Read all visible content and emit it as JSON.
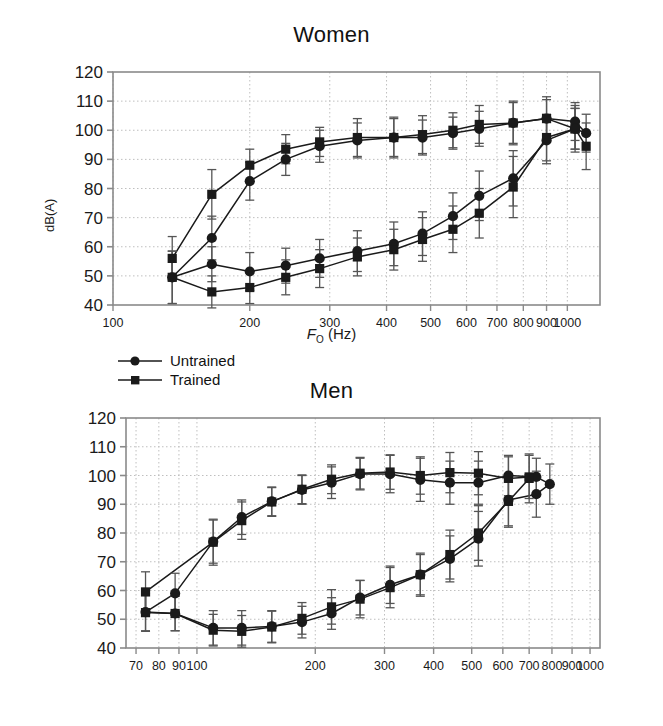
{
  "figure": {
    "xlabel_main": "F",
    "xlabel_sub": "O",
    "xlabel_unit": "(Hz)",
    "ylabel": "dB(A)"
  },
  "legend": {
    "position": "between-panels-left",
    "items": [
      {
        "label": "Untrained",
        "marker": "circle",
        "color": "#1a1a1a"
      },
      {
        "label": "Trained",
        "marker": "square",
        "color": "#1a1a1a"
      }
    ]
  },
  "colors": {
    "line": "#1a1a1a",
    "marker": "#1a1a1a",
    "errorbar": "#555555",
    "grid": "#bfbfbf",
    "axis": "#8a8a8a",
    "text": "#1a1a1a",
    "background": "#ffffff"
  },
  "chart_data": [
    {
      "type": "line",
      "id": "women",
      "title": "Women",
      "xlabel": "F_O (Hz)",
      "ylabel": "dB(A)",
      "xscale": "log",
      "xlim": [
        100,
        1180
      ],
      "ylim": [
        40,
        120
      ],
      "yticks": [
        40,
        50,
        60,
        70,
        80,
        90,
        100,
        110,
        120
      ],
      "xticks": [
        100,
        200,
        300,
        400,
        500,
        600,
        700,
        800,
        900,
        1000
      ],
      "xticklabels": [
        "100",
        "200",
        "300",
        "400",
        "500",
        "600",
        "700",
        "800",
        "900",
        "1000"
      ],
      "grid": true,
      "series": [
        {
          "name": "Untrained",
          "marker": "circle",
          "branch_upper": {
            "x": [
              165,
              200,
              240,
              285,
              345,
              415,
              480,
              560,
              640,
              760,
              900,
              1040,
              1100
            ],
            "y": [
              63.0,
              82.5,
              90.0,
              94.5,
              96.5,
              97.5,
              97.5,
              99.0,
              100.5,
              102.5,
              104.0,
              103.0,
              99.0
            ],
            "yerr": [
              7.5,
              6.5,
              5.5,
              5.5,
              6.0,
              7.0,
              6.0,
              5.5,
              6.0,
              7.0,
              6.5,
              6.5,
              6.5
            ]
          },
          "branch_lower": {
            "x": [
              135,
              165,
              200,
              240,
              285,
              345,
              415,
              480,
              560,
              640,
              760,
              900,
              1040
            ],
            "y": [
              49.5,
              54.0,
              51.5,
              53.5,
              56.0,
              58.5,
              61.0,
              64.5,
              70.5,
              77.5,
              83.5,
              96.5,
              100.5
            ],
            "yerr": [
              9.0,
              6.0,
              6.5,
              6.0,
              6.5,
              7.0,
              7.5,
              7.5,
              8.0,
              8.5,
              9.5,
              8.0,
              7.0
            ]
          }
        },
        {
          "name": "Trained",
          "marker": "square",
          "branch_upper": {
            "x": [
              135,
              165,
              200,
              240,
              285,
              345,
              415,
              480,
              560,
              640,
              760,
              900,
              1040,
              1100
            ],
            "y": [
              56.0,
              78.0,
              88.0,
              93.5,
              96.0,
              97.5,
              97.5,
              98.5,
              100.0,
              102.0,
              102.5,
              104.0,
              100.5,
              94.5
            ],
            "yerr": [
              7.5,
              8.5,
              5.5,
              5.0,
              5.0,
              6.5,
              6.5,
              6.5,
              6.0,
              6.5,
              7.5,
              7.5,
              8.0,
              8.0
            ]
          },
          "branch_lower": {
            "x": [
              135,
              165,
              200,
              240,
              285,
              345,
              415,
              480,
              560,
              640,
              760,
              900,
              1040
            ],
            "y": [
              49.5,
              44.5,
              46.0,
              49.5,
              52.5,
              56.5,
              59.0,
              62.5,
              66.0,
              71.5,
              80.5,
              97.5,
              100.5
            ],
            "yerr": [
              9.0,
              5.5,
              5.5,
              6.0,
              6.5,
              6.5,
              7.0,
              7.5,
              8.0,
              8.5,
              10.5,
              8.0,
              7.0
            ]
          }
        }
      ]
    },
    {
      "type": "line",
      "id": "men",
      "title": "Men",
      "xlabel": "F_O (Hz)",
      "ylabel": "dB(A)",
      "xscale": "log",
      "xlim": [
        66,
        1060
      ],
      "ylim": [
        40,
        120
      ],
      "yticks": [
        40,
        50,
        60,
        70,
        80,
        90,
        100,
        110,
        120
      ],
      "xticks": [
        70,
        80,
        90,
        100,
        200,
        300,
        400,
        500,
        600,
        700,
        800,
        900,
        1000
      ],
      "xticklabels": [
        "70",
        "80",
        "90",
        "100",
        "200",
        "300",
        "400",
        "500",
        "600",
        "700",
        "800",
        "900",
        "1000"
      ],
      "grid": true,
      "series": [
        {
          "name": "Untrained",
          "marker": "circle",
          "branch_upper": {
            "x": [
              88,
              110,
              130,
              155,
              185,
              220,
              260,
              310,
              370,
              440,
              520,
              620,
              730,
              790
            ],
            "y": [
              59.0,
              77.0,
              85.5,
              91.0,
              95.0,
              97.5,
              100.5,
              100.5,
              98.5,
              97.5,
              97.5,
              100.0,
              99.5,
              97.0
            ],
            "yerr": [
              7.0,
              7.5,
              6.0,
              5.0,
              5.0,
              5.5,
              5.5,
              6.5,
              7.5,
              7.5,
              7.5,
              7.0,
              6.5,
              7.0
            ]
          },
          "branch_lower": {
            "x": [
              74,
              88,
              110,
              130,
              155,
              185,
              220,
              260,
              310,
              370,
              440,
              520,
              620,
              730
            ],
            "y": [
              52.5,
              52.0,
              47.0,
              47.0,
              47.5,
              49.0,
              52.0,
              57.5,
              62.0,
              65.5,
              71.0,
              78.0,
              91.5,
              93.5
            ],
            "yerr": [
              6.5,
              6.0,
              6.0,
              6.0,
              5.5,
              5.5,
              5.5,
              6.0,
              6.5,
              7.0,
              8.0,
              9.5,
              9.0,
              8.0
            ]
          }
        },
        {
          "name": "Trained",
          "marker": "square",
          "branch_upper": {
            "x": [
              74,
              110,
              130,
              155,
              185,
              220,
              260,
              310,
              370,
              440,
              520,
              620,
              700
            ],
            "y": [
              59.5,
              76.8,
              84.3,
              90.8,
              95.2,
              98.7,
              100.8,
              101.2,
              100.0,
              101.0,
              100.8,
              99.0,
              99.5
            ],
            "yerr": [
              7.0,
              8.0,
              6.5,
              5.0,
              5.0,
              5.0,
              5.5,
              6.0,
              6.5,
              7.0,
              7.5,
              7.5,
              7.5
            ]
          },
          "branch_lower": {
            "x": [
              74,
              88,
              110,
              130,
              155,
              185,
              220,
              260,
              310,
              370,
              440,
              520,
              620,
              700
            ],
            "y": [
              52.3,
              52.0,
              46.2,
              45.8,
              47.3,
              50.3,
              54.3,
              57.0,
              61.0,
              65.5,
              72.5,
              80.0,
              91.0,
              99.0
            ],
            "yerr": [
              6.5,
              6.0,
              5.5,
              5.5,
              5.5,
              5.5,
              6.0,
              6.5,
              7.0,
              7.5,
              8.5,
              9.5,
              9.0,
              8.5
            ]
          }
        }
      ]
    }
  ]
}
